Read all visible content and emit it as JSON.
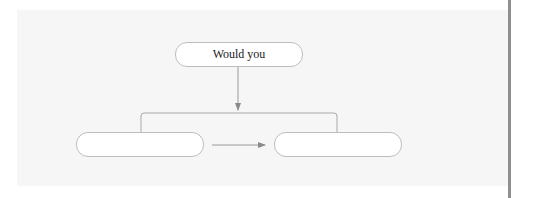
{
  "diagram": {
    "type": "flowchart",
    "nodes": [
      {
        "id": "top",
        "label": "Would you"
      },
      {
        "id": "left",
        "label": ""
      },
      {
        "id": "right",
        "label": ""
      }
    ],
    "edges": [
      {
        "from": "top",
        "to": "bracket",
        "style": "arrow-down"
      },
      {
        "from": "bracket",
        "to": "left",
        "style": "line"
      },
      {
        "from": "bracket",
        "to": "right",
        "style": "line"
      },
      {
        "from": "left",
        "to": "right",
        "style": "arrow-right"
      }
    ],
    "colors": {
      "panel_bg": "#f6f6f6",
      "node_border": "#bdbdbd",
      "connector": "#999999",
      "divider": "#8f8f8f"
    }
  }
}
